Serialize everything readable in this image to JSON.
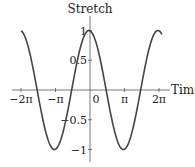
{
  "chart_data": {
    "type": "line",
    "title": "",
    "xlabel": "Time",
    "ylabel": "Stretch",
    "function": "cos(t + 0.1)",
    "xlim": [
      -6.4,
      6.55
    ],
    "ylim": [
      -1.1,
      1.1
    ],
    "grid": false,
    "legend": null,
    "x_ticks": [
      {
        "value": -6.2832,
        "label": "−2π"
      },
      {
        "value": -3.1416,
        "label": "−π"
      },
      {
        "value": 0,
        "label": "0"
      },
      {
        "value": 3.1416,
        "label": "π"
      },
      {
        "value": 6.2832,
        "label": "2π"
      }
    ],
    "y_ticks": [
      {
        "value": 1,
        "label": "1"
      },
      {
        "value": 0.5,
        "label": "0.5"
      },
      {
        "value": -0.5,
        "label": "−0.5"
      },
      {
        "value": -1,
        "label": "−1"
      }
    ],
    "series": [
      {
        "name": "Stretch",
        "color": "#444444",
        "x": [
          -6.283,
          -5.498,
          -4.712,
          -3.927,
          -3.142,
          -2.356,
          -1.571,
          -0.785,
          0,
          0.785,
          1.571,
          2.356,
          3.142,
          3.927,
          4.712,
          5.498,
          6.283,
          6.53
        ],
        "y": [
          0.995,
          0.637,
          -0.1,
          -0.771,
          -0.995,
          -0.637,
          0.1,
          0.771,
          0.995,
          0.637,
          -0.1,
          -0.771,
          -0.995,
          -0.637,
          0.1,
          0.771,
          0.995,
          0.89
        ]
      }
    ]
  },
  "axes": {
    "x_title": "Time",
    "y_title": "Stretch",
    "x_tick_labels": [
      "−2π",
      "−π",
      "0",
      "π",
      "2π"
    ],
    "y_tick_labels": [
      "1",
      "0.5",
      "−0.5",
      "−1"
    ]
  }
}
